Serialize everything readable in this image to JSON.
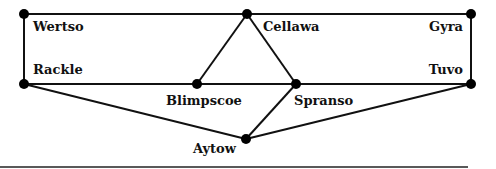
{
  "nodes": [
    {
      "id": "wertso",
      "label": "Wertso",
      "x": 24,
      "y": 14,
      "lx": 33,
      "ly": 19,
      "align": "left"
    },
    {
      "id": "cellawa",
      "label": "Cellawa",
      "x": 247,
      "y": 14,
      "lx": 263,
      "ly": 19,
      "align": "left"
    },
    {
      "id": "gyra",
      "label": "Gyra",
      "x": 471,
      "y": 14,
      "lx": 463,
      "ly": 19,
      "align": "right"
    },
    {
      "id": "rackle",
      "label": "Rackle",
      "x": 24,
      "y": 84,
      "lx": 33,
      "ly": 62,
      "align": "left"
    },
    {
      "id": "blimpscoe",
      "label": "Blimpscoe",
      "x": 197,
      "y": 84,
      "lx": 166,
      "ly": 93,
      "align": "left"
    },
    {
      "id": "spranso",
      "label": "Spranso",
      "x": 296,
      "y": 84,
      "lx": 294,
      "ly": 93,
      "align": "left"
    },
    {
      "id": "tuvo",
      "label": "Tuvo",
      "x": 471,
      "y": 84,
      "lx": 463,
      "ly": 62,
      "align": "right"
    },
    {
      "id": "aytow",
      "label": "Aytow",
      "x": 246,
      "y": 139,
      "lx": 193,
      "ly": 141,
      "align": "left"
    }
  ],
  "edges": [
    [
      "wertso",
      "cellawa"
    ],
    [
      "cellawa",
      "gyra"
    ],
    [
      "wertso",
      "rackle"
    ],
    [
      "gyra",
      "tuvo"
    ],
    [
      "rackle",
      "tuvo"
    ],
    [
      "cellawa",
      "blimpscoe"
    ],
    [
      "cellawa",
      "spranso"
    ],
    [
      "rackle",
      "aytow"
    ],
    [
      "aytow",
      "spranso"
    ],
    [
      "aytow",
      "tuvo"
    ]
  ],
  "rule": {
    "x1": 0,
    "x2": 468,
    "y": 167
  }
}
